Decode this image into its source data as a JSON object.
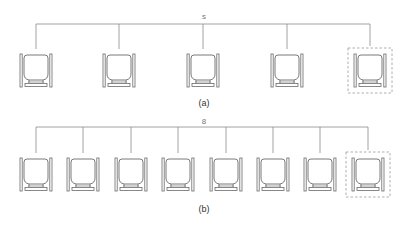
{
  "figure": {
    "panels": [
      {
        "id": "a",
        "caption": "(a)",
        "group_label": "s",
        "bracket": {
          "y": 24,
          "x_start": 36,
          "x_end": 372
        },
        "seats": [
          {
            "x": 36,
            "highlighted": false
          },
          {
            "x": 119,
            "highlighted": false
          },
          {
            "x": 203,
            "highlighted": false
          },
          {
            "x": 287,
            "highlighted": false
          },
          {
            "x": 370,
            "highlighted": true
          }
        ],
        "seat_top": 52
      },
      {
        "id": "b",
        "caption": "(b)",
        "group_label": "8",
        "bracket": {
          "y": 127,
          "x_start": 36,
          "x_end": 368
        },
        "seats": [
          {
            "x": 36,
            "highlighted": false
          },
          {
            "x": 83,
            "highlighted": false
          },
          {
            "x": 131,
            "highlighted": false
          },
          {
            "x": 178,
            "highlighted": false
          },
          {
            "x": 226,
            "highlighted": false
          },
          {
            "x": 273,
            "highlighted": false
          },
          {
            "x": 320,
            "highlighted": false
          },
          {
            "x": 368,
            "highlighted": true
          }
        ],
        "seat_top": 156
      }
    ],
    "colors": {
      "line": "#8a8a8a",
      "seat": "#6a6a6a",
      "dashed_box": "#9a9a9a"
    }
  }
}
